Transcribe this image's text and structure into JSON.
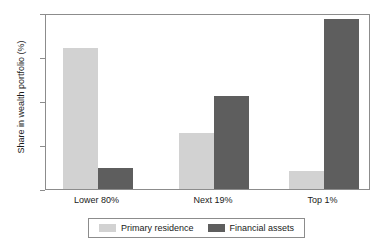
{
  "chart_data": {
    "type": "bar",
    "title": "",
    "subtitle": "",
    "xlabel": "",
    "ylabel": "Share in wealth portfolio (%)",
    "categories": [
      "Lower 80%",
      "Next 19%",
      "Top 1%"
    ],
    "series": [
      {
        "name": "Primary residence",
        "color": "#d2d2d2",
        "values": [
          64,
          25.3,
          8.3
        ]
      },
      {
        "name": "Financial assets",
        "color": "#5e5e5e",
        "values": [
          9.5,
          42.5,
          77.2
        ]
      }
    ],
    "ylim": [
      0,
      80
    ],
    "yticks": [
      0,
      20,
      40,
      60,
      80
    ],
    "ytick_labels": [
      "0",
      "20",
      "40",
      "60",
      "80"
    ],
    "grid": false,
    "legend_position": "bottom",
    "frame_color": "#8c8c8c",
    "background": "#ffffff"
  }
}
